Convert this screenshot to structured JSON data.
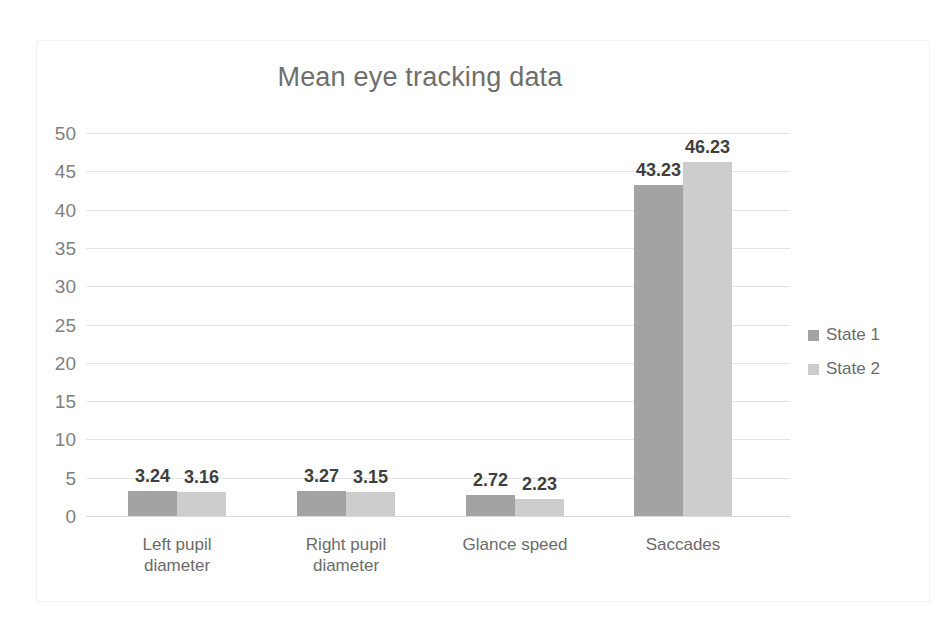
{
  "chart_data": {
    "type": "bar",
    "title": "Mean eye tracking data",
    "xlabel": "",
    "ylabel": "",
    "ylim": [
      0,
      50
    ],
    "ytick_step": 5,
    "yticks": [
      "50",
      "45",
      "40",
      "35",
      "30",
      "25",
      "20",
      "15",
      "10",
      "5",
      "0"
    ],
    "grid": true,
    "legend_position": "right",
    "categories": [
      "Left pupil diameter",
      "Right pupil diameter",
      "Glance speed",
      "Saccades"
    ],
    "category_lines": [
      [
        "Left pupil",
        "diameter"
      ],
      [
        "Right pupil",
        "diameter"
      ],
      [
        "Glance speed"
      ],
      [
        "Saccades"
      ]
    ],
    "series": [
      {
        "name": "State 1",
        "color": "#a3a3a3",
        "values": [
          3.24,
          3.27,
          2.72,
          43.23
        ],
        "labels": [
          "3.24",
          "3.27",
          "2.72",
          "43.23"
        ]
      },
      {
        "name": "State 2",
        "color": "#cdcdcd",
        "values": [
          3.16,
          3.15,
          2.23,
          46.23
        ],
        "labels": [
          "3.16",
          "3.15",
          "2.23",
          "46.23"
        ]
      }
    ]
  },
  "colors": {
    "series_1": "#a3a3a3",
    "series_2": "#cdcdcd",
    "gridline": "#e4e4e4",
    "axis_text": "#808080",
    "title_text": "#6e6e6e",
    "label_text": "#3f3f3f",
    "frame": "#f2f2f2",
    "background": "#ffffff"
  }
}
